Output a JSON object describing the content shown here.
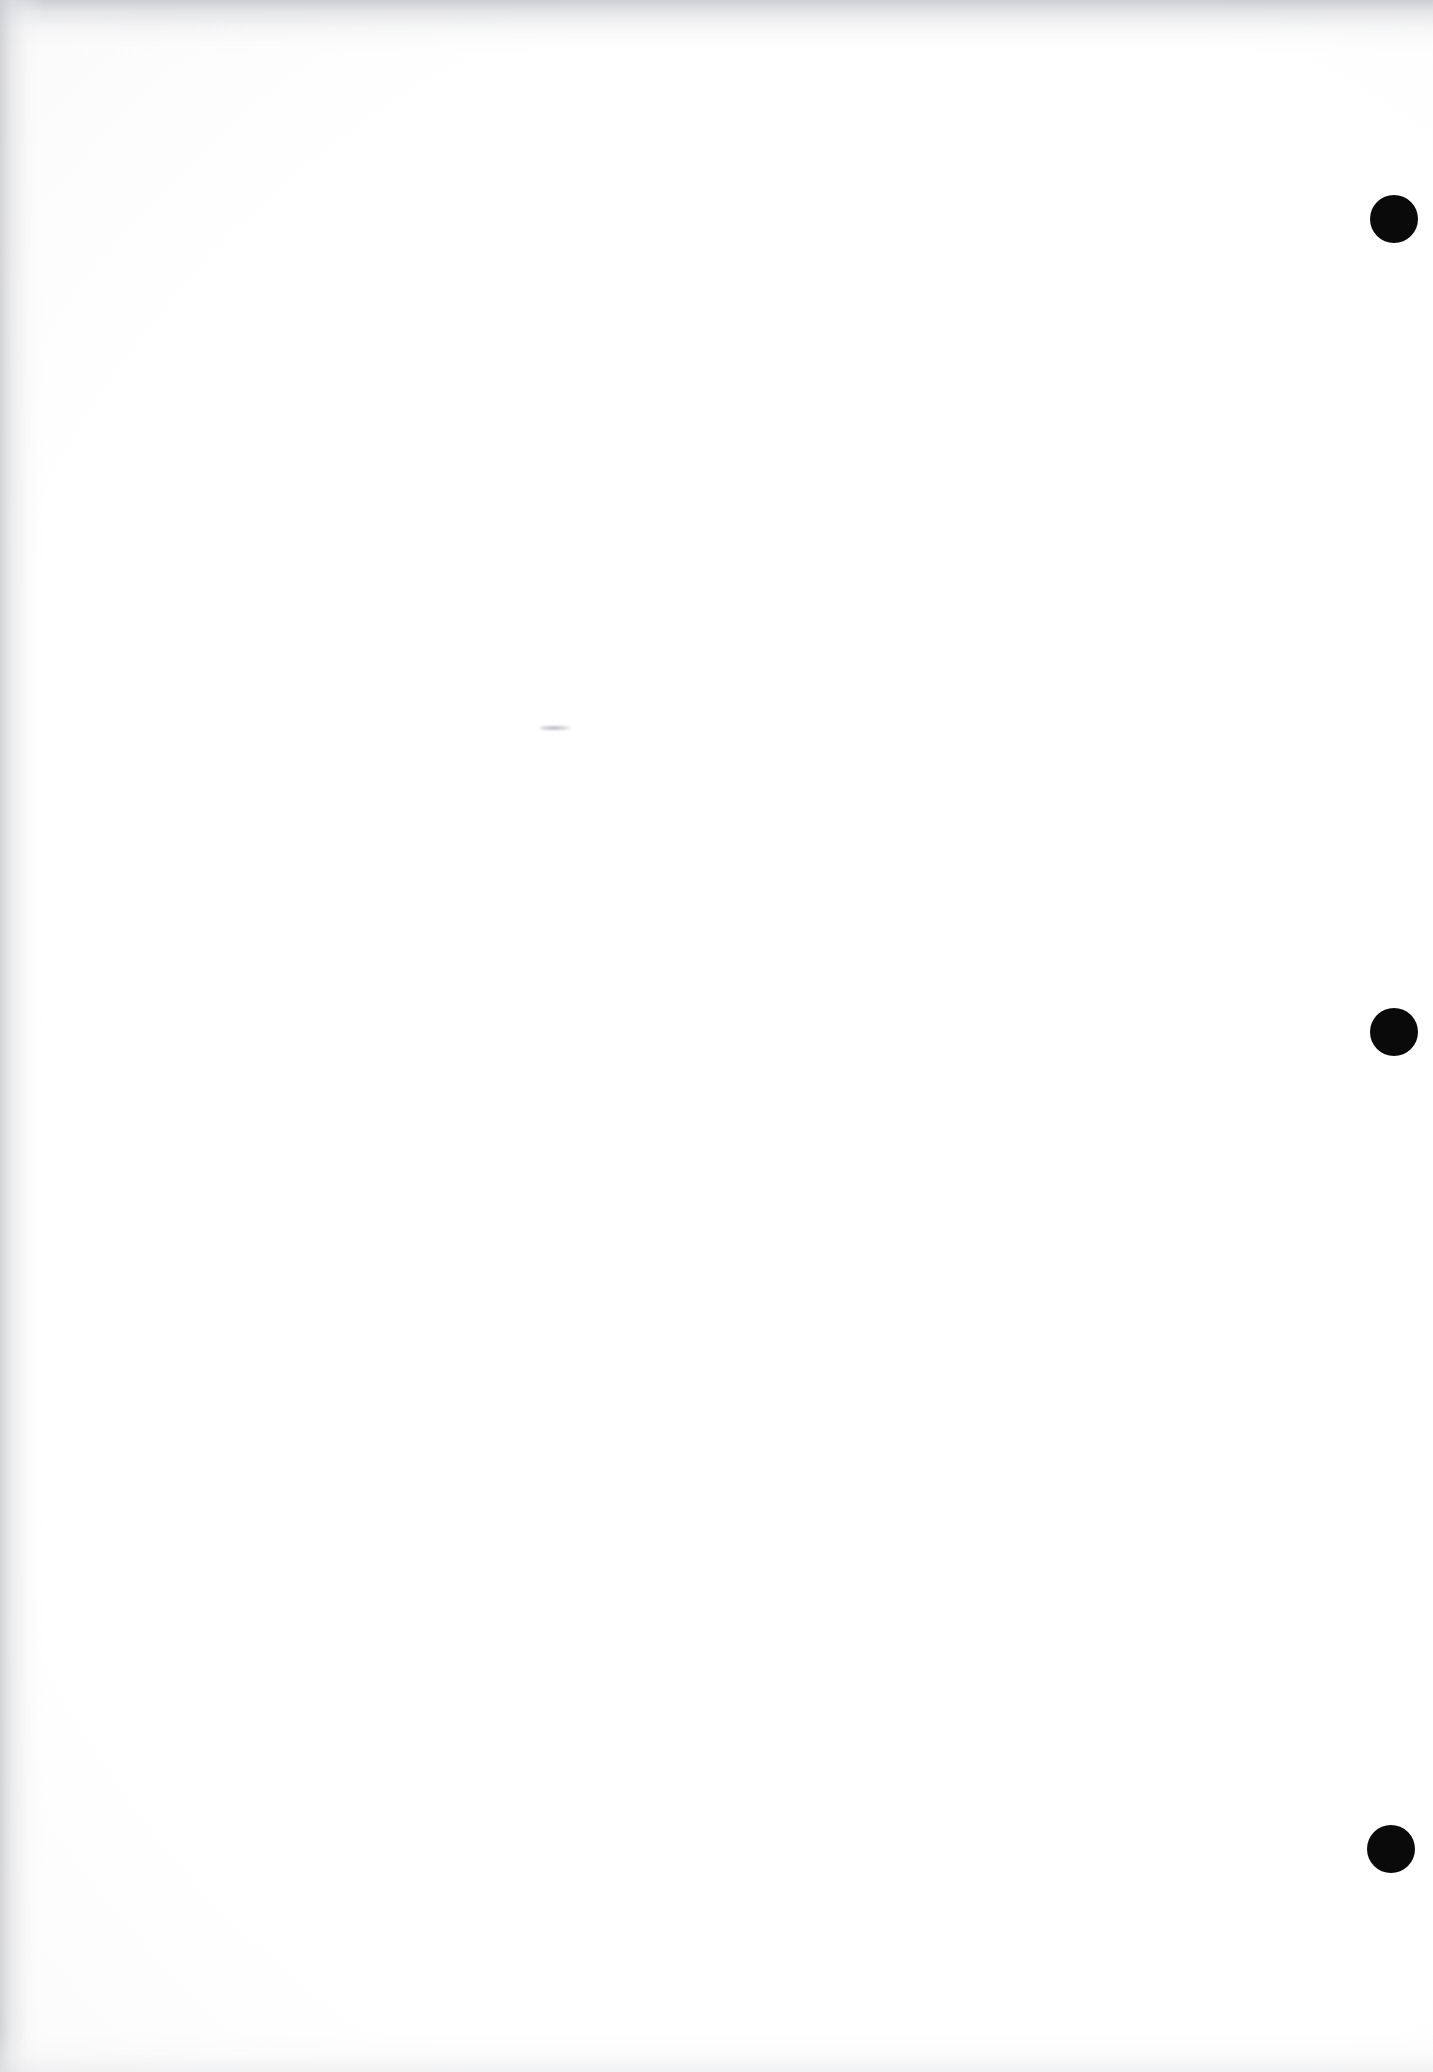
{
  "document": {
    "page_kind": "blank-scanned-page",
    "page_width_px": 1433,
    "page_height_px": 2072,
    "visible_text": "",
    "caption": ""
  },
  "paper": {
    "background_color": "#fcfcfc",
    "vignette_edge_color": "#eeeef0",
    "grain_color": "#ebeced"
  },
  "scan_artifacts": {
    "top_edge_shadow_color": "#cbccd0",
    "left_edge_shadow_color": "#cecfd3",
    "bottom_edge_shadow_color": "#e7e8ea",
    "bleed_through_color": "#e4e5e9"
  },
  "marks": {
    "registration_dot_color": "#0a0a0a",
    "registration_dots": [
      {
        "id": "dot-1",
        "cx": 1394,
        "cy": 219,
        "r": 24
      },
      {
        "id": "dot-2",
        "cx": 1394,
        "cy": 1032,
        "r": 24
      },
      {
        "id": "dot-3",
        "cx": 1391,
        "cy": 1849,
        "r": 24
      }
    ],
    "stray_mark": {
      "id": "stray-mark-1",
      "x": 538,
      "y": 726,
      "width": 34,
      "height": 4,
      "color": "#bebfc5"
    }
  }
}
